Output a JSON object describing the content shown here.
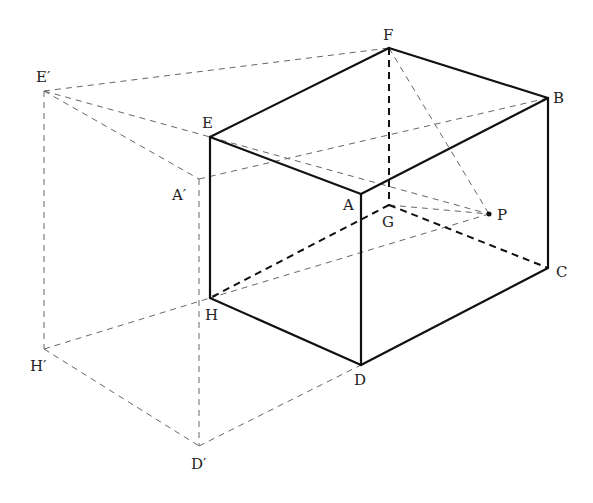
{
  "diagram": {
    "title": "",
    "points": {
      "F": {
        "label": "F",
        "x": 389,
        "y": 48,
        "lx": 383,
        "ly": 40
      },
      "B": {
        "label": "B",
        "x": 548,
        "y": 98,
        "lx": 553,
        "ly": 103
      },
      "E": {
        "label": "E",
        "x": 210,
        "y": 137,
        "lx": 202,
        "ly": 128
      },
      "A": {
        "label": "A",
        "x": 361,
        "y": 194,
        "lx": 343,
        "ly": 210
      },
      "G": {
        "label": "G",
        "x": 389,
        "y": 205,
        "lx": 382,
        "ly": 227
      },
      "P": {
        "label": "P",
        "x": 489,
        "y": 214,
        "lx": 497,
        "ly": 220
      },
      "C": {
        "label": "C",
        "x": 548,
        "y": 268,
        "lx": 556,
        "ly": 277
      },
      "H": {
        "label": "H",
        "x": 210,
        "y": 298,
        "lx": 205,
        "ly": 320
      },
      "D": {
        "label": "D",
        "x": 361,
        "y": 365,
        "lx": 354,
        "ly": 385
      },
      "E1": {
        "label": "E′",
        "x": 44,
        "y": 91,
        "lx": 36,
        "ly": 82
      },
      "A1": {
        "label": "A′",
        "x": 199,
        "y": 179,
        "lx": 172,
        "ly": 200
      },
      "H1": {
        "label": "H′",
        "x": 44,
        "y": 349,
        "lx": 30,
        "ly": 371
      },
      "D1": {
        "label": "D′",
        "x": 199,
        "y": 446,
        "lx": 191,
        "ly": 469
      }
    },
    "solid_edges": [
      [
        "E",
        "F"
      ],
      [
        "F",
        "B"
      ],
      [
        "B",
        "A"
      ],
      [
        "A",
        "E"
      ],
      [
        "E",
        "H"
      ],
      [
        "A",
        "D"
      ],
      [
        "B",
        "C"
      ],
      [
        "H",
        "D"
      ],
      [
        "D",
        "C"
      ]
    ],
    "hidden_edges": [
      [
        "F",
        "G"
      ],
      [
        "G",
        "H"
      ],
      [
        "G",
        "C"
      ]
    ],
    "construction_lines": [
      [
        "E1",
        "F"
      ],
      [
        "E1",
        "E"
      ],
      [
        "E1",
        "A1"
      ],
      [
        "E1",
        "H1"
      ],
      [
        "A1",
        "D1"
      ],
      [
        "A1",
        "B"
      ],
      [
        "H1",
        "H"
      ],
      [
        "H1",
        "D1"
      ],
      [
        "D1",
        "D"
      ],
      [
        "F",
        "P"
      ],
      [
        "G",
        "P"
      ],
      [
        "E",
        "P"
      ],
      [
        "H",
        "P"
      ]
    ],
    "marked_points": [
      "P"
    ]
  }
}
